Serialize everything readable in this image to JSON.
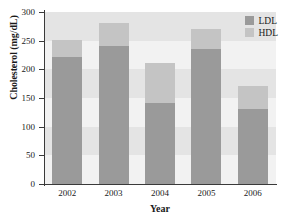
{
  "chart_data": {
    "type": "bar",
    "subtype": "stacked-bar",
    "title": "",
    "xlabel": "Year",
    "ylabel": "Cholesterol (mg/dL)",
    "categories": [
      "2002",
      "2003",
      "2004",
      "2005",
      "2006"
    ],
    "series": [
      {
        "name": "LDL",
        "values": [
          221,
          241,
          141,
          236,
          131
        ],
        "color": "#9a9a9a"
      },
      {
        "name": "HDL",
        "values": [
          30,
          40,
          70,
          35,
          40
        ],
        "color": "#c4c4c4"
      }
    ],
    "totals": [
      251,
      281,
      211,
      271,
      171
    ],
    "ylim": [
      0,
      300
    ],
    "yticks": [
      0,
      50,
      100,
      150,
      200,
      250,
      300
    ],
    "ytick_labels": [
      "0",
      "50",
      "100",
      "150",
      "200",
      "250",
      "300"
    ],
    "xtick_labels": [
      "2002",
      "2003",
      "2004",
      "2005",
      "2006"
    ],
    "grid": false,
    "background_bands": true,
    "legend_position": "top-right",
    "legend_entries": [
      "LDL",
      "HDL"
    ]
  },
  "axes": {
    "y_label": "Cholesterol (mg/dL)",
    "x_label": "Year"
  },
  "legend": {
    "items": [
      {
        "label": "LDL",
        "color": "#9a9a9a"
      },
      {
        "label": "HDL",
        "color": "#c4c4c4"
      }
    ]
  },
  "colors": {
    "ldl": "#9a9a9a",
    "hdl": "#c4c4c4",
    "plot_background": "#ebebeb",
    "band_light": "#f2f2f2",
    "band_dark": "#e4e4e4",
    "axis": "#3a3a3a",
    "text": "#1a1a1a"
  }
}
